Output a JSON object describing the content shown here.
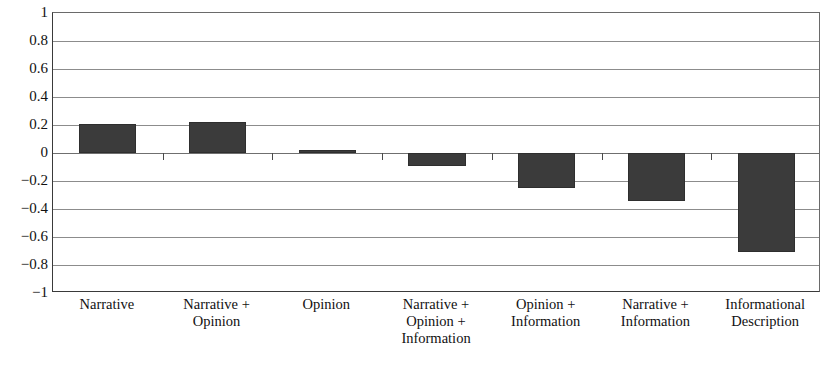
{
  "chart_data": {
    "type": "bar",
    "title": "",
    "subtitle": "",
    "xlabel": "",
    "ylabel": "",
    "categories": [
      "Narrative",
      "Narrative + Opinion",
      "Opinion",
      "Narrative + Opinion + Information",
      "Opinion + Information",
      "Narrative + Information",
      "Informational Description"
    ],
    "category_lines": [
      [
        "Narrative"
      ],
      [
        "Narrative +",
        "Opinion"
      ],
      [
        "Opinion"
      ],
      [
        "Narrative +",
        "Opinion +",
        "Information"
      ],
      [
        "Opinion +",
        "Information"
      ],
      [
        "Narrative +",
        "Information"
      ],
      [
        "Informational",
        "Description"
      ]
    ],
    "values": [
      0.21,
      0.22,
      0.02,
      -0.09,
      -0.25,
      -0.34,
      -0.71
    ],
    "ylim": [
      -1,
      1
    ],
    "ytick_values": [
      1,
      0.8,
      0.6,
      0.4,
      0.2,
      0,
      -0.2,
      -0.4,
      -0.6,
      -0.8,
      -1
    ],
    "ytick_labels": [
      "1",
      "0.8",
      "0.6",
      "0.4",
      "0.2",
      "0",
      "−0.2",
      "−0.4",
      "−0.6",
      "−0.8",
      "−1"
    ],
    "grid": true,
    "grid_axis": "y",
    "legend": false,
    "legend_position": "none",
    "bar_color": "#3b3b3b",
    "axis_color": "#3a3a3a",
    "gridline_color": "#8c8c8c",
    "background_color": "#ffffff",
    "bar_width_ratio": 0.52
  }
}
